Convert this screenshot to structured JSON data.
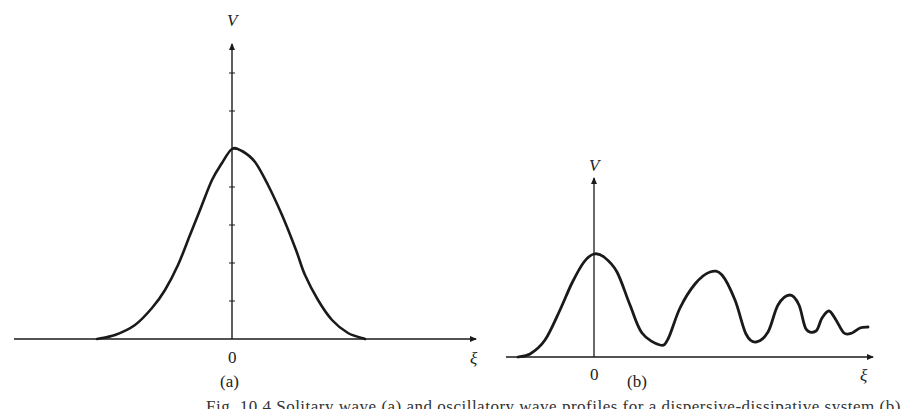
{
  "figure": {
    "panels": [
      {
        "id": "a",
        "label": "(a)",
        "y_axis_label": "V",
        "x_axis_label": "ξ",
        "origin_label": "0",
        "description": "Single bell-shaped (solitary wave) profile symmetric about ξ = 0",
        "curve_points": [
          [
            97,
            339
          ],
          [
            115,
            335
          ],
          [
            135,
            325
          ],
          [
            152,
            308
          ],
          [
            165,
            290
          ],
          [
            178,
            265
          ],
          [
            190,
            235
          ],
          [
            200,
            210
          ],
          [
            212,
            180
          ],
          [
            222,
            163
          ],
          [
            232,
            149
          ],
          [
            242,
            151
          ],
          [
            255,
            162
          ],
          [
            268,
            185
          ],
          [
            282,
            215
          ],
          [
            296,
            250
          ],
          [
            305,
            275
          ],
          [
            318,
            300
          ],
          [
            332,
            320
          ],
          [
            348,
            333
          ],
          [
            365,
            339
          ]
        ]
      },
      {
        "id": "b",
        "label": "(b)",
        "y_axis_label": "V",
        "x_axis_label": "ξ",
        "origin_label": "0",
        "description": "Oscillatory profile with decaying peaks to the right of ξ = 0",
        "curve_points": [
          [
            518,
            357
          ],
          [
            530,
            354
          ],
          [
            545,
            340
          ],
          [
            560,
            310
          ],
          [
            572,
            283
          ],
          [
            584,
            262
          ],
          [
            594,
            254
          ],
          [
            604,
            257
          ],
          [
            617,
            272
          ],
          [
            630,
            305
          ],
          [
            642,
            333
          ],
          [
            660,
            345
          ],
          [
            668,
            339
          ],
          [
            680,
            308
          ],
          [
            695,
            284
          ],
          [
            710,
            272
          ],
          [
            722,
            275
          ],
          [
            735,
            300
          ],
          [
            746,
            334
          ],
          [
            756,
            342
          ],
          [
            768,
            332
          ],
          [
            778,
            305
          ],
          [
            790,
            295
          ],
          [
            799,
            305
          ],
          [
            806,
            329
          ],
          [
            816,
            331
          ],
          [
            822,
            318
          ],
          [
            829,
            311
          ],
          [
            836,
            320
          ],
          [
            844,
            333
          ],
          [
            852,
            333
          ],
          [
            860,
            328
          ],
          [
            868,
            327
          ]
        ]
      }
    ],
    "caption_partial": "Fig. 10.4  Solitary wave (a) and oscillatory wave profiles for a dispersive-dissipative system (b)"
  },
  "style": {
    "ink": "#1a1a1a",
    "background": "#ffffff"
  }
}
